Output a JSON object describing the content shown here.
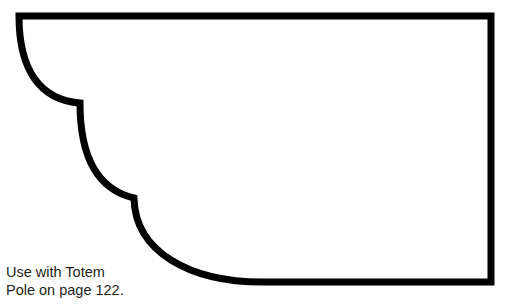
{
  "diagram": {
    "type": "pattern-outline",
    "stroke_color": "#000000",
    "background_color": "#ffffff",
    "shape_description": "Rectangle with three scalloped curves on the lower-left edge"
  },
  "caption": {
    "line1": "Use with Totem",
    "line2": "Pole on page 122."
  }
}
